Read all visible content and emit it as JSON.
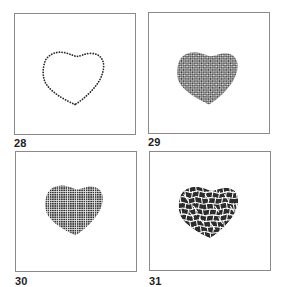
{
  "figures": [
    {
      "id": "28",
      "label": "28",
      "fill_style": "dotted-outline",
      "description": "Heart shape drawn as a dotted outline"
    },
    {
      "id": "29",
      "label": "29",
      "fill_style": "diagonal-checker",
      "description": "Heart filled with fine diagonal checkerboard texture"
    },
    {
      "id": "30",
      "label": "30",
      "fill_style": "orthogonal-grid",
      "description": "Heart filled with dark square grid texture"
    },
    {
      "id": "31",
      "label": "31",
      "fill_style": "irregular-cells",
      "description": "Heart filled with irregular cobblestone cell texture"
    }
  ],
  "colors": {
    "ink": "#2a2a2a",
    "frame": "#8a8a8a",
    "background": "#ffffff"
  }
}
